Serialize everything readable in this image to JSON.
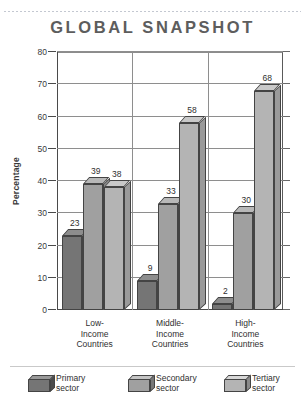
{
  "title": "GLOBAL SNAPSHOT",
  "chart_data": {
    "type": "bar",
    "title": "GLOBAL SNAPSHOT",
    "xlabel": "",
    "ylabel": "Percentage",
    "ylim": [
      0,
      80
    ],
    "yticks": [
      0,
      10,
      20,
      30,
      40,
      50,
      60,
      70,
      80
    ],
    "grid": true,
    "legend_position": "bottom",
    "style": "3d-grouped-column",
    "categories": [
      "Low-Income Countries",
      "Middle-Income Countries",
      "High-Income Countries"
    ],
    "category_lines": [
      [
        "Low-",
        "Income",
        "Countries"
      ],
      [
        "Middle-",
        "Income",
        "Countries"
      ],
      [
        "High-",
        "Income",
        "Countries"
      ]
    ],
    "series": [
      {
        "name": "Primary sector",
        "color": "#757575",
        "values": [
          23,
          9,
          2
        ]
      },
      {
        "name": "Secondary sector",
        "color": "#a0a0a0",
        "values": [
          39,
          33,
          30
        ]
      },
      {
        "name": "Tertiary sector",
        "color": "#b4b4b4",
        "values": [
          38,
          58,
          68
        ]
      }
    ]
  },
  "legend": [
    {
      "line1": "Primary",
      "line2": "sector"
    },
    {
      "line1": "Secondary",
      "line2": "sector"
    },
    {
      "line1": "Tertiary",
      "line2": "sector"
    }
  ]
}
